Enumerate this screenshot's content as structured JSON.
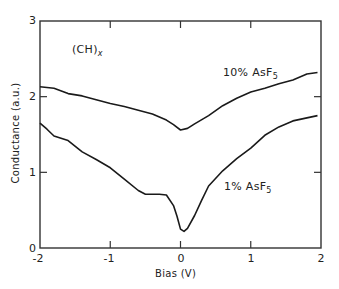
{
  "chart_data": {
    "type": "line",
    "title": "",
    "xlabel": "Bias (V)",
    "ylabel": "Conductance (a.u.)",
    "xlim": [
      -2,
      2
    ],
    "ylim": [
      0,
      3
    ],
    "x_ticks": [
      -2,
      -1,
      0,
      1,
      2
    ],
    "y_ticks": [
      0,
      1,
      2,
      3
    ],
    "x_tick_labels": [
      "-2",
      "-1",
      "0",
      "1",
      "2"
    ],
    "y_tick_labels": [
      "0",
      "1",
      "2",
      "3"
    ],
    "grid": false,
    "legend": "none (inline curve labels)",
    "annotations": [
      {
        "text": "(CH)x",
        "x": -1.3,
        "y": 2.55
      },
      {
        "text": "10% AsF5",
        "x": 0.45,
        "y": 2.35
      },
      {
        "text": "1% AsF5",
        "x": 0.6,
        "y": 1.0
      }
    ],
    "series": [
      {
        "name": "10% AsF5",
        "x": [
          -2.0,
          -1.8,
          -1.6,
          -1.4,
          -1.2,
          -1.0,
          -0.8,
          -0.6,
          -0.4,
          -0.2,
          -0.1,
          0.0,
          0.1,
          0.2,
          0.4,
          0.6,
          0.8,
          1.0,
          1.2,
          1.4,
          1.6,
          1.8,
          1.95
        ],
        "values": [
          2.13,
          2.11,
          2.04,
          2.01,
          1.96,
          1.91,
          1.87,
          1.82,
          1.77,
          1.69,
          1.63,
          1.56,
          1.58,
          1.64,
          1.75,
          1.88,
          1.98,
          2.06,
          2.11,
          2.17,
          2.22,
          2.3,
          2.32
        ]
      },
      {
        "name": "1% AsF5",
        "x": [
          -2.0,
          -1.9,
          -1.8,
          -1.6,
          -1.4,
          -1.2,
          -1.0,
          -0.8,
          -0.6,
          -0.5,
          -0.3,
          -0.2,
          -0.1,
          -0.05,
          0.0,
          0.05,
          0.1,
          0.2,
          0.3,
          0.4,
          0.6,
          0.8,
          1.0,
          1.2,
          1.4,
          1.6,
          1.8,
          1.95
        ],
        "values": [
          1.65,
          1.57,
          1.48,
          1.42,
          1.27,
          1.17,
          1.06,
          0.91,
          0.76,
          0.71,
          0.71,
          0.7,
          0.56,
          0.42,
          0.25,
          0.22,
          0.26,
          0.43,
          0.63,
          0.82,
          1.02,
          1.18,
          1.32,
          1.49,
          1.6,
          1.68,
          1.72,
          1.75
        ]
      }
    ]
  },
  "plot": {
    "frame": {
      "left": 40,
      "top": 21,
      "right": 321,
      "bottom": 248
    },
    "line_color": "#1a1a1a",
    "axis_color": "#333333"
  },
  "labels": {
    "ylabel": "Conductance (a.u.)",
    "xlabel": "Bias (V)",
    "material_main": "(CH)",
    "material_sub": "x",
    "series1_main": "10% AsF",
    "series1_sub": "5",
    "series2_main": "1% AsF",
    "series2_sub": "5",
    "y_ticks": [
      "0",
      "1",
      "2",
      "3"
    ],
    "x_ticks": [
      "-2",
      "-1",
      "0",
      "1",
      "2"
    ]
  }
}
